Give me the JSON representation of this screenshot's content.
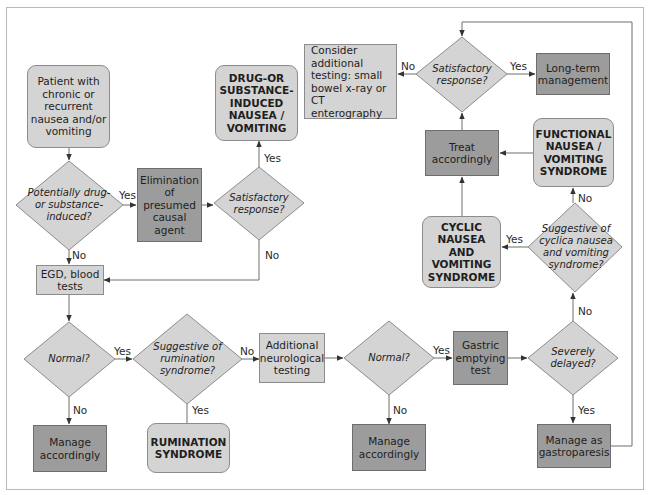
{
  "diagram": {
    "type": "clinical-flowchart",
    "colors": {
      "light_fill": "#d4d4d4",
      "dark_fill": "#9c9c9c",
      "decision_fill": "#d4d4d4",
      "line": "#6e6e6e",
      "frame": "#b9b9b9"
    },
    "nodes": {
      "start": {
        "text": "Patient with chronic or recurrent nausea and/or vomiting",
        "kind": "terminal"
      },
      "q_drug": {
        "text": "Potentially drug-or substance-induced?",
        "kind": "decision"
      },
      "elimination": {
        "text": "Elimination of presumed causal agent",
        "kind": "action"
      },
      "q_satisfactory_1": {
        "text": "Satisfactory response?",
        "kind": "decision"
      },
      "drug_induced": {
        "text": "DRUG-OR SUBSTANCE-INDUCED NAUSEA / VOMITING",
        "kind": "diagnosis"
      },
      "egd": {
        "text": "EGD, blood tests",
        "kind": "process"
      },
      "q_normal_1": {
        "text": "Normal?",
        "kind": "decision"
      },
      "manage_1": {
        "text": "Manage accordingly",
        "kind": "action"
      },
      "q_rumination": {
        "text": "Suggestive of rumination syndrome?",
        "kind": "decision"
      },
      "rumination": {
        "text": "RUMINATION SYNDROME",
        "kind": "diagnosis"
      },
      "neuro": {
        "text": "Additional neurological testing",
        "kind": "process"
      },
      "q_normal_2": {
        "text": "Normal?",
        "kind": "decision"
      },
      "manage_2": {
        "text": "Manage accordingly",
        "kind": "action"
      },
      "gastric": {
        "text": "Gastric emptying test",
        "kind": "action"
      },
      "q_delayed": {
        "text": "Severely delayed?",
        "kind": "decision"
      },
      "gastroparesis": {
        "text": "Manage as gastroparesis",
        "kind": "action"
      },
      "q_cyclic": {
        "text": "Suggestive of cyclica nausea and vomiting syndrome?",
        "kind": "decision"
      },
      "cyclic": {
        "text": "CYCLIC NAUSEA AND VOMITING SYNDROME",
        "kind": "diagnosis"
      },
      "functional": {
        "text": "FUNCTIONAL NAUSEA / VOMITING SYNDROME",
        "kind": "diagnosis"
      },
      "treat": {
        "text": "Treat accordingly",
        "kind": "action"
      },
      "q_satisfactory_2": {
        "text": "Satisfactory response?",
        "kind": "decision"
      },
      "long_term": {
        "text": "Long-term management",
        "kind": "action"
      },
      "consider": {
        "text": "Consider additional testing: small bowel x-ray or CT enterography",
        "kind": "process"
      }
    },
    "edge_labels": {
      "drug_yes": "Yes",
      "drug_no": "No",
      "sat1_yes": "Yes",
      "sat1_no": "No",
      "normal1_yes": "Yes",
      "normal1_no": "No",
      "rum_yes": "Yes",
      "rum_no": "No",
      "normal2_yes": "Yes",
      "normal2_no": "No",
      "delayed_yes": "Yes",
      "delayed_no": "No",
      "cyclic_yes": "Yes",
      "cyclic_no": "No",
      "sat2_yes": "Yes",
      "sat2_no": "No"
    },
    "edges": [
      [
        "start",
        "q_drug",
        ""
      ],
      [
        "q_drug",
        "elimination",
        "Yes"
      ],
      [
        "q_drug",
        "egd",
        "No"
      ],
      [
        "elimination",
        "q_satisfactory_1",
        ""
      ],
      [
        "q_satisfactory_1",
        "drug_induced",
        "Yes"
      ],
      [
        "q_satisfactory_1",
        "egd",
        "No"
      ],
      [
        "egd",
        "q_normal_1",
        ""
      ],
      [
        "q_normal_1",
        "q_rumination",
        "Yes"
      ],
      [
        "q_normal_1",
        "manage_1",
        "No"
      ],
      [
        "q_rumination",
        "rumination",
        "Yes"
      ],
      [
        "q_rumination",
        "neuro",
        "No"
      ],
      [
        "neuro",
        "q_normal_2",
        ""
      ],
      [
        "q_normal_2",
        "gastric",
        "Yes"
      ],
      [
        "q_normal_2",
        "manage_2",
        "No"
      ],
      [
        "gastric",
        "q_delayed",
        ""
      ],
      [
        "q_delayed",
        "gastroparesis",
        "Yes"
      ],
      [
        "q_delayed",
        "q_cyclic",
        "No"
      ],
      [
        "q_cyclic",
        "cyclic",
        "Yes"
      ],
      [
        "q_cyclic",
        "functional",
        "No"
      ],
      [
        "cyclic",
        "treat",
        ""
      ],
      [
        "functional",
        "treat",
        ""
      ],
      [
        "treat",
        "q_satisfactory_2",
        ""
      ],
      [
        "gastroparesis",
        "q_satisfactory_2",
        ""
      ],
      [
        "q_satisfactory_2",
        "long_term",
        "Yes"
      ],
      [
        "q_satisfactory_2",
        "consider",
        "No"
      ]
    ]
  }
}
